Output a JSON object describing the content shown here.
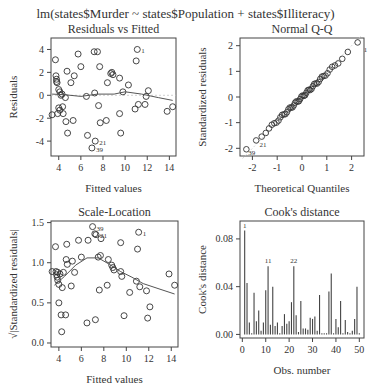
{
  "title": "lm(states$Murder ~ states$Population + states$Illiteracy)",
  "chart_data": [
    {
      "type": "scatter",
      "title": "Residuals vs Fitted",
      "xlabel": "Fitted values",
      "ylabel": "Residuals",
      "xticks": [
        4,
        6,
        8,
        10,
        12,
        14
      ],
      "yticks": [
        -4,
        -2,
        0,
        2,
        4
      ],
      "xlim": [
        3.3,
        14.6
      ],
      "ylim": [
        -5.3,
        5.0
      ],
      "labeled_points": [
        {
          "label": "1",
          "x": 11.1,
          "y": 4.0
        },
        {
          "label": "21",
          "x": 7.3,
          "y": -4.0
        },
        {
          "label": "39",
          "x": 7.0,
          "y": -4.6
        }
      ],
      "points": [
        [
          3.4,
          -1.7
        ],
        [
          3.7,
          3.1
        ],
        [
          3.75,
          1.7
        ],
        [
          3.8,
          1.4
        ],
        [
          3.8,
          1.2
        ],
        [
          3.85,
          1.1
        ],
        [
          3.9,
          -1.6
        ],
        [
          4.0,
          0.5
        ],
        [
          4.0,
          -1.1
        ],
        [
          4.1,
          0.3
        ],
        [
          4.1,
          -1.3
        ],
        [
          4.2,
          0.0
        ],
        [
          4.3,
          0.1
        ],
        [
          4.35,
          -1.0
        ],
        [
          4.4,
          -1.6
        ],
        [
          4.6,
          -0.2
        ],
        [
          4.65,
          -2.3
        ],
        [
          4.75,
          2.1
        ],
        [
          4.8,
          -3.3
        ],
        [
          5.1,
          1.1
        ],
        [
          5.3,
          -2.2
        ],
        [
          5.4,
          1.7
        ],
        [
          5.75,
          3.6
        ],
        [
          6.0,
          2.5
        ],
        [
          6.5,
          -0.1
        ],
        [
          6.6,
          -3.5
        ],
        [
          7.0,
          -4.6
        ],
        [
          7.2,
          3.8
        ],
        [
          7.25,
          0.2
        ],
        [
          7.3,
          -4.0
        ],
        [
          7.5,
          3.8
        ],
        [
          7.6,
          -0.9
        ],
        [
          7.7,
          2.5
        ],
        [
          7.75,
          -2.4
        ],
        [
          8.3,
          -2.2
        ],
        [
          8.4,
          1.1
        ],
        [
          8.7,
          1.9
        ],
        [
          8.8,
          2.0
        ],
        [
          8.9,
          1.8
        ],
        [
          9.5,
          1.5
        ],
        [
          9.5,
          -1.6
        ],
        [
          9.6,
          -3.3
        ],
        [
          9.8,
          0.3
        ],
        [
          10.3,
          0.9
        ],
        [
          10.9,
          -1.2
        ],
        [
          11.0,
          3.0
        ],
        [
          11.1,
          4.0
        ],
        [
          11.2,
          -0.8
        ],
        [
          11.8,
          -0.8
        ],
        [
          11.9,
          -0.1
        ],
        [
          12.1,
          0.4
        ],
        [
          13.8,
          -1.4
        ],
        [
          14.3,
          -1.0
        ]
      ],
      "smoother": [
        [
          3.4,
          0.1
        ],
        [
          4.5,
          0.05
        ],
        [
          6.0,
          -0.1
        ],
        [
          7.5,
          0.1
        ],
        [
          9.0,
          0.1
        ],
        [
          10.0,
          0.3
        ],
        [
          11.5,
          0.1
        ],
        [
          13.0,
          -0.2
        ],
        [
          14.3,
          -0.45
        ]
      ]
    },
    {
      "type": "scatter",
      "title": "Normal Q-Q",
      "xlabel": "Theoretical Quantiles",
      "ylabel": "Standardized residuals",
      "xticks": [
        -2,
        -1,
        0,
        1,
        2
      ],
      "yticks": [
        -2,
        -1,
        0,
        1,
        2
      ],
      "xlim": [
        -2.5,
        2.5
      ],
      "ylim": [
        -2.3,
        2.3
      ],
      "labeled_points": [
        {
          "label": "1",
          "x": 2.33,
          "y": 1.9
        },
        {
          "label": "39",
          "x": -2.33,
          "y": -2.1
        },
        {
          "label": "21",
          "x": -1.88,
          "y": -1.8
        }
      ],
      "reference_line": {
        "intercept": 0,
        "slope": 1
      }
    },
    {
      "type": "scatter",
      "title": "Scale-Location",
      "xlabel": "Fitted values",
      "ylabel": "√|Standardized residuals|",
      "xticks": [
        4,
        6,
        8,
        10,
        12,
        14
      ],
      "yticks": [
        0.0,
        0.5,
        1.0,
        1.5
      ],
      "xlim": [
        3.3,
        14.6
      ],
      "ylim": [
        -0.05,
        1.52
      ],
      "labeled_points": [
        {
          "label": "39",
          "x": 7.0,
          "y": 1.45
        },
        {
          "label": "21",
          "x": 7.3,
          "y": 1.36
        },
        {
          "label": "1",
          "x": 11.1,
          "y": 1.38
        }
      ],
      "points": [
        [
          3.4,
          0.89
        ],
        [
          3.7,
          1.2
        ],
        [
          3.75,
          0.89
        ],
        [
          3.8,
          0.85
        ],
        [
          3.85,
          0.82
        ],
        [
          3.9,
          0.88
        ],
        [
          3.9,
          0.78
        ],
        [
          4.0,
          0.5
        ],
        [
          4.0,
          0.73
        ],
        [
          4.1,
          0.86
        ],
        [
          4.2,
          0.35
        ],
        [
          4.25,
          0.14
        ],
        [
          4.3,
          0.69
        ],
        [
          4.4,
          0.88
        ],
        [
          4.6,
          0.35
        ],
        [
          4.65,
          1.04
        ],
        [
          4.7,
          1.23
        ],
        [
          4.75,
          0.98
        ],
        [
          5.1,
          0.71
        ],
        [
          5.2,
          1.02
        ],
        [
          5.4,
          0.88
        ],
        [
          5.75,
          1.28
        ],
        [
          6.0,
          1.07
        ],
        [
          6.5,
          0.25
        ],
        [
          6.6,
          1.28
        ],
        [
          7.0,
          1.45
        ],
        [
          7.2,
          1.36
        ],
        [
          7.25,
          0.29
        ],
        [
          7.3,
          1.35
        ],
        [
          7.5,
          1.07
        ],
        [
          7.6,
          0.66
        ],
        [
          7.7,
          1.09
        ],
        [
          7.75,
          1.3
        ],
        [
          8.3,
          0.72
        ],
        [
          8.4,
          1.04
        ],
        [
          8.7,
          0.97
        ],
        [
          8.8,
          0.94
        ],
        [
          8.9,
          0.91
        ],
        [
          9.5,
          0.89
        ],
        [
          9.5,
          1.25
        ],
        [
          9.6,
          0.83
        ],
        [
          9.8,
          0.34
        ],
        [
          10.3,
          0.63
        ],
        [
          10.9,
          0.77
        ],
        [
          11.0,
          1.17
        ],
        [
          11.1,
          1.38
        ],
        [
          11.2,
          0.7
        ],
        [
          11.8,
          0.65
        ],
        [
          11.9,
          0.31
        ],
        [
          12.1,
          0.45
        ],
        [
          13.8,
          0.86
        ],
        [
          14.3,
          0.72
        ]
      ],
      "smoother": [
        [
          3.6,
          0.72
        ],
        [
          4.5,
          0.83
        ],
        [
          5.5,
          0.97
        ],
        [
          6.5,
          1.06
        ],
        [
          7.5,
          1.06
        ],
        [
          8.5,
          0.98
        ],
        [
          9.5,
          0.89
        ],
        [
          10.5,
          0.82
        ],
        [
          11.5,
          0.74
        ],
        [
          13.0,
          0.67
        ],
        [
          14.3,
          0.61
        ]
      ]
    },
    {
      "type": "bar",
      "title": "Cook's distance",
      "xlabel": "Obs. number",
      "ylabel": "Cook's distance",
      "xticks": [
        0,
        10,
        20,
        30,
        40,
        50
      ],
      "yticks": [
        0.0,
        0.04,
        0.08
      ],
      "xlim": [
        -1,
        52
      ],
      "ylim": [
        -0.003,
        0.095
      ],
      "labeled_bars": [
        {
          "label": "1",
          "obs": 1
        },
        {
          "label": "11",
          "obs": 11
        },
        {
          "label": "22",
          "obs": 22
        }
      ],
      "categories": [
        1,
        2,
        3,
        4,
        5,
        6,
        7,
        8,
        9,
        10,
        11,
        12,
        13,
        14,
        15,
        16,
        17,
        18,
        19,
        20,
        21,
        22,
        23,
        24,
        25,
        26,
        27,
        28,
        29,
        30,
        31,
        32,
        33,
        34,
        35,
        36,
        37,
        38,
        39,
        40,
        41,
        42,
        43,
        44,
        45,
        46,
        47,
        48,
        49,
        50
      ],
      "values": [
        0.087,
        0.043,
        0.01,
        0.001,
        0.035,
        0.011,
        0.02,
        0.003,
        0.01,
        0.037,
        0.057,
        0.008,
        0.04,
        0.007,
        0.01,
        0.001,
        0.007,
        0.017,
        0.009,
        0.011,
        0.027,
        0.057,
        0.016,
        0.002,
        0.028,
        0.005,
        0.005,
        0.004,
        0.014,
        0.013,
        0.015,
        0.003,
        0.033,
        0.001,
        0.001,
        0.001,
        0.036,
        0.051,
        0.001,
        0.013,
        0.006,
        0.028,
        0.001,
        0.012,
        0.002,
        0.001,
        0.003,
        0.013,
        0.04,
        0.001
      ]
    }
  ]
}
